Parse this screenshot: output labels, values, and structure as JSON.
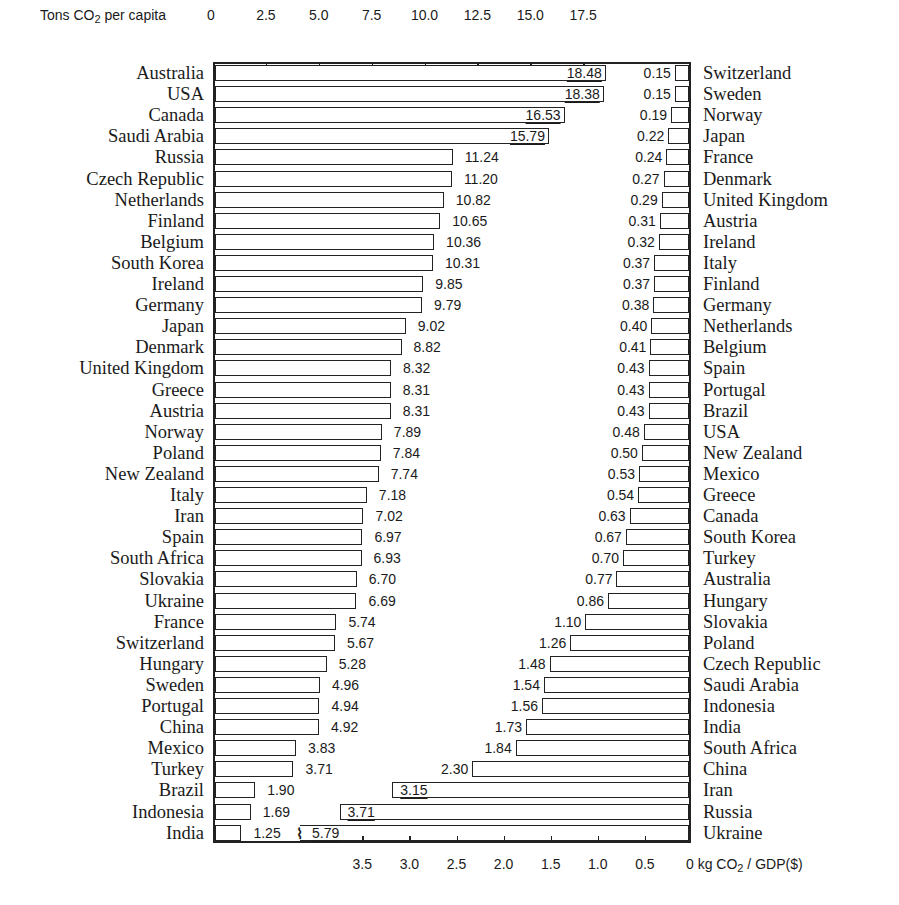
{
  "chart_data": {
    "type": "bar",
    "layout": "back-to-back horizontal bar chart (two independently sorted rankings)",
    "top_axis": {
      "title_prefix": "Tons CO",
      "title_sub": "2",
      "title_suffix": " per capita",
      "ticks": [
        "0",
        "2.5",
        "5.0",
        "7.5",
        "10.0",
        "12.5",
        "15.0",
        "17.5"
      ],
      "tick_values": [
        0,
        2.5,
        5.0,
        7.5,
        10.0,
        12.5,
        15.0,
        17.5
      ],
      "range": [
        0,
        22.5
      ]
    },
    "bottom_axis": {
      "title_prefix": "0 kg CO",
      "title_sub": "2",
      "title_suffix": " / GDP($)",
      "ticks": [
        "3.5",
        "3.0",
        "2.5",
        "2.0",
        "1.5",
        "1.0",
        "0.5"
      ],
      "tick_values": [
        3.5,
        3.0,
        2.5,
        2.0,
        1.5,
        1.0,
        0.5
      ],
      "range": [
        5.08,
        0
      ],
      "direction": "right-to-left"
    },
    "grid": false,
    "series": [
      {
        "name": "Tons CO2 per capita",
        "side": "left",
        "categories": [
          "Australia",
          "USA",
          "Canada",
          "Saudi Arabia",
          "Russia",
          "Czech Republic",
          "Netherlands",
          "Finland",
          "Belgium",
          "South Korea",
          "Ireland",
          "Germany",
          "Japan",
          "Denmark",
          "United Kingdom",
          "Greece",
          "Austria",
          "Norway",
          "Poland",
          "New Zealand",
          "Italy",
          "Iran",
          "Spain",
          "South Africa",
          "Slovakia",
          "Ukraine",
          "France",
          "Switzerland",
          "Hungary",
          "Sweden",
          "Portugal",
          "China",
          "Mexico",
          "Turkey",
          "Brazil",
          "Indonesia",
          "India"
        ],
        "values": [
          18.48,
          18.38,
          16.53,
          15.79,
          11.24,
          11.2,
          10.82,
          10.65,
          10.36,
          10.31,
          9.85,
          9.79,
          9.02,
          8.82,
          8.32,
          8.31,
          8.31,
          7.89,
          7.84,
          7.74,
          7.18,
          7.02,
          6.97,
          6.93,
          6.7,
          6.69,
          5.74,
          5.67,
          5.28,
          4.96,
          4.94,
          4.92,
          3.83,
          3.71,
          1.9,
          1.69,
          1.25
        ],
        "labels": [
          "18.48",
          "18.38",
          "16.53",
          "15.79",
          "11.24",
          "11.20",
          "10.82",
          "10.65",
          "10.36",
          "10.31",
          "9.85",
          "9.79",
          "9.02",
          "8.82",
          "8.32",
          "8.31",
          "8.31",
          "7.89",
          "7.84",
          "7.74",
          "7.18",
          "7.02",
          "6.97",
          "6.93",
          "6.70",
          "6.69",
          "5.74",
          "5.67",
          "5.28",
          "4.96",
          "4.94",
          "4.92",
          "3.83",
          "3.71",
          "1.90",
          "1.69",
          "1.25"
        ]
      },
      {
        "name": "kg CO2 / GDP($)",
        "side": "right",
        "categories": [
          "Switzerland",
          "Sweden",
          "Norway",
          "Japan",
          "France",
          "Denmark",
          "United Kingdom",
          "Austria",
          "Ireland",
          "Italy",
          "Finland",
          "Germany",
          "Netherlands",
          "Belgium",
          "Spain",
          "Portugal",
          "Brazil",
          "USA",
          "New Zealand",
          "Mexico",
          "Greece",
          "Canada",
          "South Korea",
          "Turkey",
          "Australia",
          "Hungary",
          "Slovakia",
          "Poland",
          "Czech Republic",
          "Saudi Arabia",
          "Indonesia",
          "India",
          "South Africa",
          "China",
          "Iran",
          "Russia",
          "Ukraine"
        ],
        "values": [
          0.15,
          0.15,
          0.19,
          0.22,
          0.24,
          0.27,
          0.29,
          0.31,
          0.32,
          0.37,
          0.37,
          0.38,
          0.4,
          0.41,
          0.43,
          0.43,
          0.43,
          0.48,
          0.5,
          0.53,
          0.54,
          0.63,
          0.67,
          0.7,
          0.77,
          0.86,
          1.1,
          1.26,
          1.48,
          1.54,
          1.56,
          1.73,
          1.84,
          2.3,
          3.15,
          3.71,
          5.79
        ],
        "labels": [
          "0.15",
          "0.15",
          "0.19",
          "0.22",
          "0.24",
          "0.27",
          "0.29",
          "0.31",
          "0.32",
          "0.37",
          "0.37",
          "0.38",
          "0.40",
          "0.41",
          "0.43",
          "0.43",
          "0.43",
          "0.48",
          "0.50",
          "0.53",
          "0.54",
          "0.63",
          "0.67",
          "0.70",
          "0.77",
          "0.86",
          "1.10",
          "1.26",
          "1.48",
          "1.54",
          "1.56",
          "1.73",
          "1.84",
          "2.30",
          "3.15",
          "3.71",
          "5.79"
        ],
        "annotations": [
          "Ukraine bar (5.79) is truncated with a break mark"
        ]
      }
    ]
  }
}
